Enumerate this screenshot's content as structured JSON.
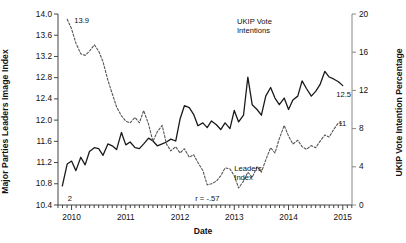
{
  "chart_data": {
    "type": "line",
    "title": "",
    "xlabel": "Date",
    "ylabel_left": "Major Parties Leaders Image Index",
    "ylabel_right": "UKIP Vote Intention Percentage",
    "xlim": [
      2009.75,
      2015.17
    ],
    "ylim_left": [
      10.4,
      14.0
    ],
    "ylim_right": [
      0,
      20
    ],
    "xticks": [
      "2010",
      "2011",
      "2012",
      "2013",
      "2014",
      "2015"
    ],
    "xtick_values": [
      2010,
      2011,
      2012,
      2013,
      2014,
      2015
    ],
    "yticks_left": [
      "10.4",
      "10.8",
      "11.2",
      "11.6",
      "12.0",
      "12.4",
      "12.8",
      "13.2",
      "13.6",
      "14.0"
    ],
    "ytick_values_left": [
      10.4,
      10.8,
      11.2,
      11.6,
      12.0,
      12.4,
      12.8,
      13.2,
      13.6,
      14.0
    ],
    "yticks_right": [
      "0",
      "4",
      "8",
      "12",
      "16",
      "20"
    ],
    "ytick_values_right": [
      0,
      4,
      8,
      12,
      16,
      20
    ],
    "grid": false,
    "legend_position": "inline-annotations",
    "annotations": [
      {
        "name": "correlation",
        "text": "r = -.57",
        "x": 2012.28,
        "y_left": 10.52
      },
      {
        "name": "ukip-series-label",
        "text": "UKIP Vote\nIntentions",
        "x": 2013.05,
        "y_left": 13.85
      },
      {
        "name": "leaders-series-label",
        "text": "Leaders\nIndex",
        "x": 2013.0,
        "y_left": 11.08
      },
      {
        "name": "ukip-start-value",
        "text": "2",
        "x": 2009.93,
        "y_left": 10.52
      },
      {
        "name": "leaders-start-value",
        "text": "13.9",
        "x": 2010.05,
        "y_left": 13.87
      },
      {
        "name": "ukip-end-value",
        "text": "12.5",
        "x": 2014.88,
        "y_left": 12.47
      },
      {
        "name": "leaders-end-value",
        "text": "11",
        "x": 2014.92,
        "y_left": 11.93
      }
    ],
    "series": [
      {
        "name": "UKIP Vote Intentions",
        "axis": "right",
        "style": "solid",
        "color": "#1a1a1a",
        "x": [
          2009.83,
          2009.92,
          2010.0,
          2010.08,
          2010.17,
          2010.25,
          2010.33,
          2010.42,
          2010.5,
          2010.58,
          2010.67,
          2010.75,
          2010.83,
          2010.92,
          2011.0,
          2011.08,
          2011.17,
          2011.25,
          2011.33,
          2011.42,
          2011.5,
          2011.58,
          2011.67,
          2011.75,
          2011.83,
          2011.92,
          2012.0,
          2012.08,
          2012.17,
          2012.25,
          2012.33,
          2012.42,
          2012.5,
          2012.58,
          2012.67,
          2012.75,
          2012.83,
          2012.92,
          2013.0,
          2013.08,
          2013.17,
          2013.25,
          2013.33,
          2013.42,
          2013.5,
          2013.58,
          2013.67,
          2013.75,
          2013.83,
          2013.92,
          2014.0,
          2014.08,
          2014.17,
          2014.25,
          2014.33,
          2014.42,
          2014.5,
          2014.58,
          2014.67,
          2014.75,
          2014.83,
          2014.92,
          2015.0
        ],
        "values": [
          2.0,
          4.3,
          4.6,
          3.6,
          5.0,
          4.2,
          5.6,
          6.0,
          5.9,
          5.2,
          6.4,
          6.2,
          5.8,
          7.6,
          6.3,
          6.6,
          6.0,
          5.9,
          6.4,
          7.0,
          6.7,
          6.2,
          6.4,
          6.6,
          6.9,
          6.7,
          9.0,
          10.4,
          10.2,
          9.5,
          8.3,
          8.6,
          8.1,
          8.8,
          8.4,
          7.9,
          8.6,
          8.0,
          9.9,
          8.7,
          9.4,
          13.4,
          10.5,
          10.0,
          9.4,
          11.4,
          12.3,
          11.2,
          10.5,
          11.2,
          10.0,
          11.0,
          11.4,
          13.0,
          12.2,
          11.4,
          11.9,
          12.6,
          14.0,
          13.4,
          13.2,
          12.9,
          12.5
        ]
      },
      {
        "name": "Leaders Index",
        "axis": "left",
        "style": "dashed",
        "color": "#555555",
        "x": [
          2009.92,
          2010.0,
          2010.08,
          2010.17,
          2010.25,
          2010.33,
          2010.42,
          2010.5,
          2010.58,
          2010.67,
          2010.75,
          2010.83,
          2010.92,
          2011.0,
          2011.08,
          2011.17,
          2011.25,
          2011.33,
          2011.42,
          2011.5,
          2011.58,
          2011.67,
          2011.75,
          2011.83,
          2011.92,
          2012.0,
          2012.08,
          2012.17,
          2012.25,
          2012.33,
          2012.42,
          2012.5,
          2012.58,
          2012.67,
          2012.75,
          2012.83,
          2012.92,
          2013.0,
          2013.08,
          2013.17,
          2013.25,
          2013.33,
          2013.42,
          2013.5,
          2013.58,
          2013.67,
          2013.75,
          2013.83,
          2013.92,
          2014.0,
          2014.08,
          2014.17,
          2014.25,
          2014.33,
          2014.42,
          2014.5,
          2014.58,
          2014.67,
          2014.75,
          2014.83,
          2014.92,
          2015.0
        ],
        "values": [
          13.9,
          13.72,
          13.45,
          13.25,
          13.22,
          13.3,
          13.42,
          13.3,
          13.1,
          12.75,
          12.5,
          12.25,
          12.08,
          11.98,
          11.95,
          12.05,
          11.95,
          12.18,
          11.92,
          11.6,
          11.78,
          11.9,
          11.55,
          11.42,
          11.5,
          11.38,
          11.46,
          11.3,
          11.35,
          11.2,
          11.05,
          10.78,
          10.8,
          10.85,
          10.95,
          11.1,
          11.08,
          10.95,
          10.72,
          10.85,
          11.02,
          10.92,
          11.12,
          11.02,
          11.25,
          11.48,
          11.38,
          11.65,
          11.9,
          11.7,
          11.55,
          11.62,
          11.5,
          11.45,
          11.52,
          11.48,
          11.6,
          11.72,
          11.68,
          11.82,
          11.95,
          11.93
        ]
      }
    ]
  }
}
